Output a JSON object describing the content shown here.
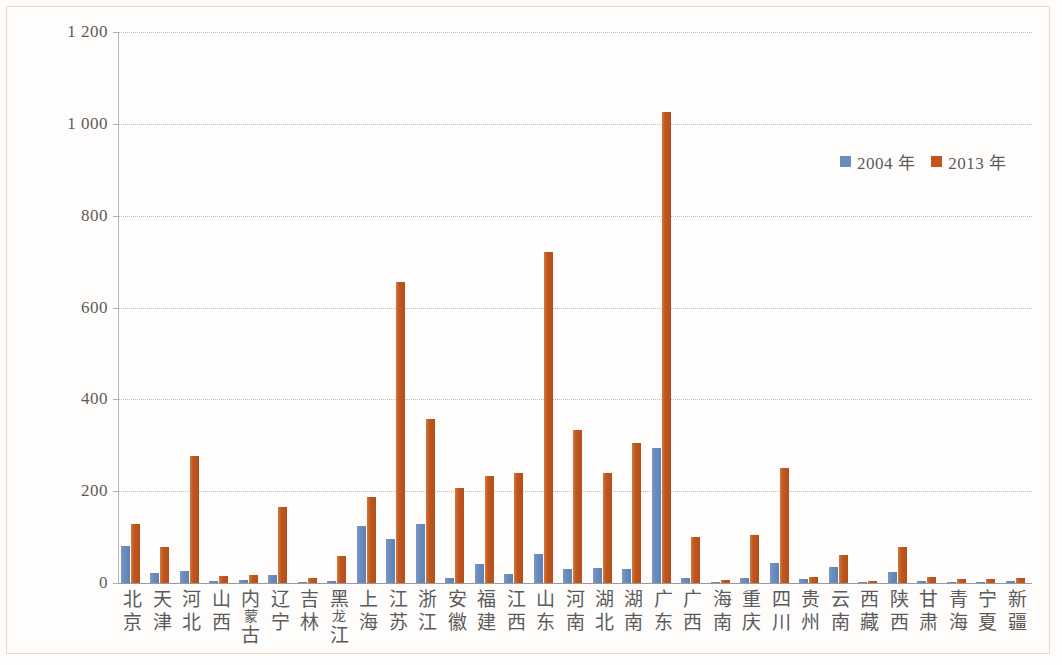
{
  "chart_data": {
    "type": "bar",
    "title": "",
    "subtitle": "",
    "xlabel": "",
    "ylabel": "",
    "ylim": [
      0,
      1200
    ],
    "yticks": [
      0,
      200,
      400,
      600,
      800,
      1000,
      1200
    ],
    "ytick_labels": [
      "0",
      "200",
      "400",
      "600",
      "800",
      "1 000",
      "1 200"
    ],
    "grid": true,
    "legend_position": "top-right",
    "categories": [
      "北京",
      "天津",
      "河北",
      "山西",
      "内蒙古",
      "辽宁",
      "吉林",
      "黑龙江",
      "上海",
      "江苏",
      "浙江",
      "安徽",
      "福建",
      "江西",
      "山东",
      "河南",
      "湖北",
      "湖南",
      "广东",
      "广西",
      "海南",
      "重庆",
      "四川",
      "贵州",
      "云南",
      "西藏",
      "陕西",
      "甘肃",
      "青海",
      "宁夏",
      "新疆"
    ],
    "series": [
      {
        "name": "2004 年",
        "color": "#6a8cbe",
        "values": [
          80,
          22,
          27,
          4,
          6,
          18,
          3,
          5,
          125,
          95,
          128,
          11,
          41,
          19,
          63,
          31,
          33,
          30,
          293,
          10,
          2,
          11,
          43,
          8,
          35,
          2,
          25,
          4,
          2,
          2,
          5
        ]
      },
      {
        "name": "2013 年",
        "color": "#c0561e",
        "values": [
          128,
          79,
          276,
          16,
          18,
          165,
          11,
          58,
          188,
          655,
          358,
          208,
          232,
          240,
          720,
          333,
          240,
          305,
          1025,
          100,
          6,
          105,
          250,
          13,
          62,
          5,
          78,
          13,
          8,
          9,
          11
        ]
      }
    ]
  },
  "legend": {
    "items": [
      {
        "label": "2004 年",
        "color": "#6a8cbe"
      },
      {
        "label": "2013 年",
        "color": "#c0561e"
      }
    ]
  },
  "axis": {
    "y_labels": [
      "1 200",
      "1 000",
      "800",
      "600",
      "400",
      "200",
      "0"
    ]
  }
}
